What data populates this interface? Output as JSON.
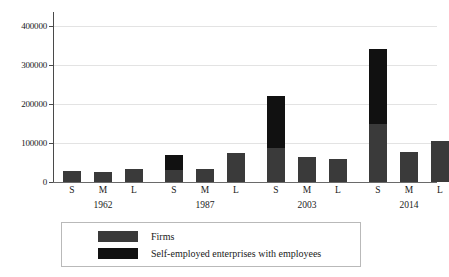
{
  "chart_data": {
    "type": "bar",
    "stacked": true,
    "title": "",
    "subtitle": "",
    "xlabel": "",
    "ylabel": "",
    "ylim": [
      0,
      430000
    ],
    "grid": true,
    "legend_position": "bottom",
    "yticks": [
      0,
      100000,
      200000,
      300000,
      400000
    ],
    "ytick_labels": [
      "0",
      "100000",
      "200000",
      "300000",
      "400000"
    ],
    "groups": [
      "1962",
      "1987",
      "2003",
      "2014"
    ],
    "categories": [
      "S",
      "M",
      "L",
      "S",
      "M",
      "L",
      "S",
      "M",
      "L",
      "S",
      "M",
      "L"
    ],
    "series": [
      {
        "name": "Firms",
        "color": "#3a3a3a",
        "values": [
          29000,
          26000,
          33000,
          31000,
          32000,
          73000,
          85000,
          62000,
          59000,
          146000,
          77000,
          104000
        ]
      },
      {
        "name": "Self-employed enterprises with employees",
        "color": "#111111",
        "values": [
          0,
          0,
          0,
          38000,
          0,
          0,
          132000,
          0,
          0,
          189000,
          0,
          0
        ]
      }
    ],
    "totals": [
      29000,
      26000,
      33000,
      69000,
      32000,
      73000,
      217000,
      62000,
      59000,
      335000,
      77000,
      104000
    ]
  },
  "legend": {
    "items": [
      {
        "label": "Firms",
        "color": "#3a3a3a"
      },
      {
        "label": "Self-employed enterprises with employees",
        "color": "#111111"
      }
    ]
  },
  "axis": {
    "y_tick_labels": [
      "400000",
      "300000",
      "200000",
      "100000",
      "0"
    ]
  }
}
